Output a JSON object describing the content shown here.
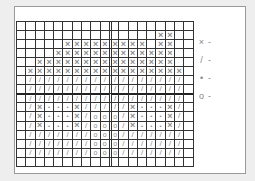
{
  "chart": {
    "columns": 19,
    "rows": 16,
    "thick_line_after_row": 7,
    "double_line_before_column": 10,
    "symbols": {
      "X": "×",
      "/": "/",
      ".": "•",
      "O": "o",
      "-": ""
    },
    "grid": [
      "-------------------",
      "---------------XX--",
      "-----XXXXXXXXX-XX--",
      "----XXXXXXXXXXXXX--",
      "--XXXXXXXXXXXXXXX--",
      "-XXXXXXXXXXXXXXXXX-",
      "-/////////////////-",
      "-/////////////////-",
      "-/////////////////-",
      "-/X...X/////X...X/-",
      "-/X...X/OOO/X...X/-",
      "-/X...X/OOO/X...X/-",
      "-///////OOO///////-",
      "-///////OOO///////-",
      "-///////OOO///////-",
      "-------------------"
    ]
  },
  "legend": [
    {
      "symbol": "×",
      "label": "-"
    },
    {
      "symbol": "/",
      "label": "-"
    },
    {
      "symbol": "•",
      "label": "-"
    },
    {
      "symbol": "o",
      "label": "-"
    }
  ]
}
